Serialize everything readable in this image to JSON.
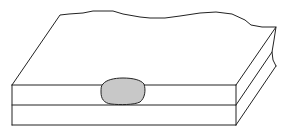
{
  "diagram": {
    "title": "",
    "colors": {
      "background": "#ffffff",
      "stroke": "#222222",
      "nugget_fill": "#c8c8c8"
    },
    "parts": [
      {
        "id": "top-sheet",
        "label": ""
      },
      {
        "id": "bottom-sheet",
        "label": ""
      },
      {
        "id": "weld-nugget",
        "label": ""
      }
    ]
  }
}
